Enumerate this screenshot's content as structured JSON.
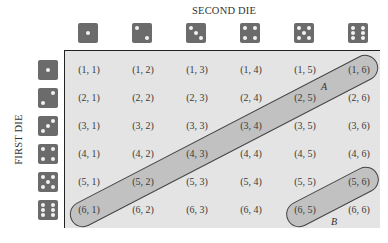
{
  "labels": {
    "second_die": "SECOND DIE",
    "first_die": "FIRST DIE"
  },
  "dice_faces": [
    1,
    2,
    3,
    4,
    5,
    6
  ],
  "grid": {
    "rows": [
      [
        "(1, 1)",
        "(1, 2)",
        "(1, 3)",
        "(1, 4)",
        "(1, 5)",
        "(1, 6)"
      ],
      [
        "(2, 1)",
        "(2, 2)",
        "(2, 3)",
        "(2, 4)",
        "(2, 5)",
        "(2, 6)"
      ],
      [
        "(3, 1)",
        "(3, 2)",
        "(3, 3)",
        "(3, 4)",
        "(3, 5)",
        "(3, 6)"
      ],
      [
        "(4, 1)",
        "(4, 2)",
        "(4, 3)",
        "(4, 4)",
        "(4, 5)",
        "(4, 6)"
      ],
      [
        "(5, 1)",
        "(5, 2)",
        "(5, 3)",
        "(5, 4)",
        "(5, 5)",
        "(5, 6)"
      ],
      [
        "(6, 1)",
        "(6, 2)",
        "(6, 3)",
        "(6, 4)",
        "(6, 5)",
        "(6, 6)"
      ]
    ]
  },
  "events": {
    "A": {
      "label": "A",
      "cells": [
        "(6, 1)",
        "(5, 2)",
        "(4, 3)",
        "(3, 4)",
        "(2, 5)",
        "(1, 6)"
      ]
    },
    "B": {
      "label": "B",
      "cells": [
        "(6, 5)",
        "(5, 6)"
      ]
    }
  },
  "colors": {
    "die": "#6b6b6b",
    "pip": "#f2f2f2",
    "grid_bg": "#e4e4e4",
    "band_fill": "#a8a8a8"
  }
}
